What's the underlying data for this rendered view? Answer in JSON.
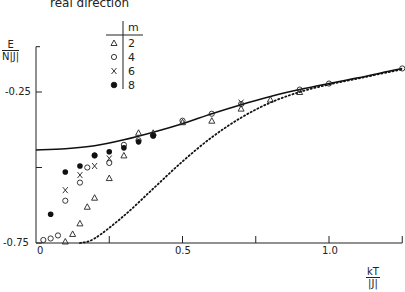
{
  "chart_data": {
    "type": "scatter",
    "title": "real direction",
    "xlabel": "kT/|J|",
    "ylabel": "E/(N|J|)",
    "xlim": [
      0,
      1.25
    ],
    "ylim": [
      -0.75,
      -0.1
    ],
    "x_ticks": [
      0,
      0.25,
      0.5,
      0.75,
      1.0,
      1.25
    ],
    "x_tick_labels": [
      "0",
      "",
      "0.5",
      "",
      "1.0",
      ""
    ],
    "y_ticks": [
      -0.25,
      -0.5,
      -0.75
    ],
    "y_tick_labels": [
      "-0.25",
      "",
      "-0.75"
    ],
    "grid": false,
    "legend": {
      "title": "m",
      "position": "upper-left",
      "entries": [
        {
          "marker": "triangle",
          "label": "2"
        },
        {
          "marker": "open-circle",
          "label": "4"
        },
        {
          "marker": "x",
          "label": "6"
        },
        {
          "marker": "filled-circle",
          "label": "8"
        }
      ]
    },
    "series": [
      {
        "name": "exact (solid)",
        "style": "solid-line",
        "x": [
          0,
          0.1,
          0.2,
          0.3,
          0.4,
          0.5,
          0.6,
          0.7,
          0.8,
          0.9,
          1.0,
          1.1,
          1.2,
          1.25
        ],
        "y": [
          -0.442,
          -0.438,
          -0.428,
          -0.408,
          -0.383,
          -0.355,
          -0.322,
          -0.292,
          -0.265,
          -0.242,
          -0.222,
          -0.203,
          -0.182,
          -0.172
        ]
      },
      {
        "name": "approximation (dotted)",
        "style": "dotted-line",
        "x": [
          0.15,
          0.2,
          0.3,
          0.4,
          0.5,
          0.6,
          0.7,
          0.8,
          0.9,
          1.0,
          1.1,
          1.2,
          1.25
        ],
        "y": [
          -0.75,
          -0.735,
          -0.66,
          -0.57,
          -0.48,
          -0.4,
          -0.335,
          -0.285,
          -0.25,
          -0.225,
          -0.205,
          -0.185,
          -0.175
        ]
      },
      {
        "name": "m=2",
        "marker": "triangle",
        "x": [
          0.1,
          0.125,
          0.15,
          0.175,
          0.2,
          0.25,
          0.3,
          0.35,
          0.4,
          0.5,
          0.6,
          0.7,
          0.8,
          0.9
        ],
        "y": [
          -0.745,
          -0.72,
          -0.685,
          -0.63,
          -0.6,
          -0.535,
          -0.46,
          -0.385,
          -0.385,
          -0.35,
          -0.345,
          -0.305,
          -0.275,
          -0.25
        ]
      },
      {
        "name": "m=4",
        "marker": "open-circle",
        "x": [
          0.025,
          0.05,
          0.075,
          0.1,
          0.15,
          0.175,
          0.2,
          0.25,
          0.3,
          0.35,
          0.4,
          0.5,
          0.6,
          0.7,
          0.9,
          1.0,
          1.25
        ],
        "y": [
          -0.74,
          -0.735,
          -0.725,
          -0.61,
          -0.55,
          -0.5,
          -0.46,
          -0.485,
          -0.425,
          -0.41,
          -0.395,
          -0.345,
          -0.322,
          -0.29,
          -0.242,
          -0.222,
          -0.172
        ]
      },
      {
        "name": "m=6",
        "marker": "x",
        "x": [
          0.1,
          0.15,
          0.2,
          0.25,
          0.7
        ],
        "y": [
          -0.575,
          -0.525,
          -0.495,
          -0.47,
          -0.285
        ]
      },
      {
        "name": "m=8",
        "marker": "filled-circle",
        "x": [
          0.05,
          0.1,
          0.15,
          0.2,
          0.25,
          0.3,
          0.35,
          0.4
        ],
        "y": [
          -0.655,
          -0.515,
          -0.495,
          -0.46,
          -0.448,
          -0.435,
          -0.415,
          -0.395
        ]
      }
    ]
  },
  "labels": {
    "title": "real direction",
    "y_num": "E",
    "y_den": "N|J|",
    "x_num": "kT",
    "x_den": "|J|",
    "y_tick_top": "-0.25",
    "y_tick_bottom": "-0.75",
    "x_tick_0": "0",
    "x_tick_05": "0.5",
    "x_tick_10": "1.0",
    "legend_title": "m",
    "legend_2": "2",
    "legend_4": "4",
    "legend_6": "6",
    "legend_8": "8"
  }
}
